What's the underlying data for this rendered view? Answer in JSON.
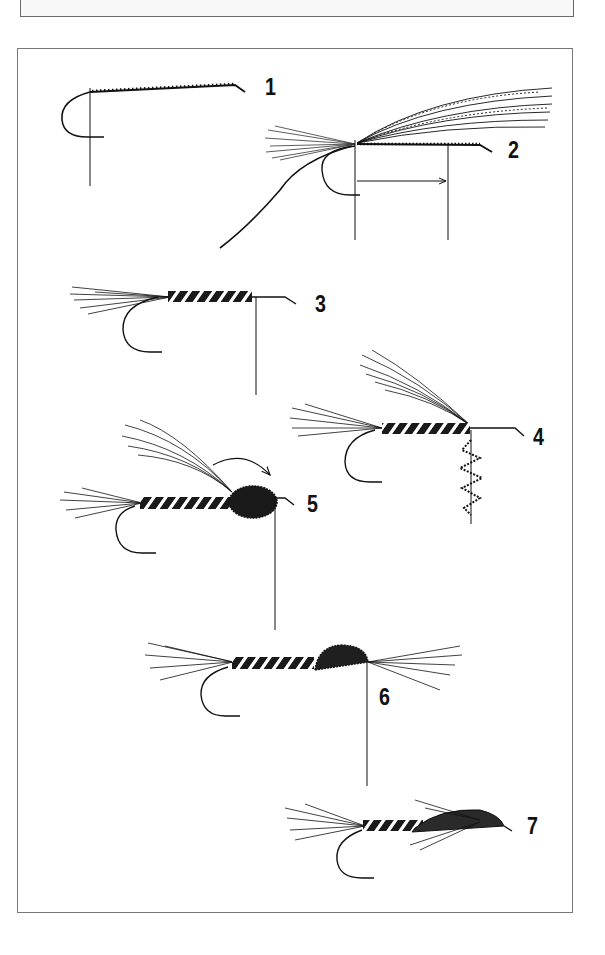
{
  "figure": {
    "type": "fly-tying-sequence-illustration",
    "steps": [
      {
        "number": "1",
        "description": "bare hook with thread base"
      },
      {
        "number": "2",
        "description": "tail and wing fibers tied in, thread hanging"
      },
      {
        "number": "3",
        "description": "tail tied, ribbed body wrapped"
      },
      {
        "number": "4",
        "description": "wing raised, dubbing loop hanging"
      },
      {
        "number": "5",
        "description": "dubbed thorax, wing folded forward (arrow)"
      },
      {
        "number": "6",
        "description": "wing case formed over thorax, fibers forward"
      },
      {
        "number": "7",
        "description": "finished fly"
      }
    ],
    "colors": {
      "ink": "#111111",
      "frame": "#777777",
      "background": "#ffffff"
    }
  }
}
